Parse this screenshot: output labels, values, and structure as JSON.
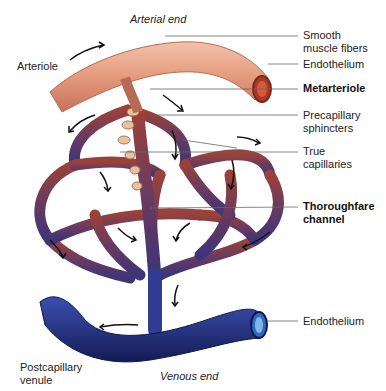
{
  "diagram": {
    "ends": {
      "arterial": "Arterial end",
      "venous": "Venous end"
    },
    "labels": {
      "arteriole": "Arteriole",
      "smooth_muscle": "Smooth\nmuscle fibers",
      "endothelium_top": "Endothelium",
      "metarteriole": "Metarteriole",
      "precapillary": "Precapillary\nsphincters",
      "true_capillaries": "True\ncapillaries",
      "thoroughfare": "Thoroughfare\nchannel",
      "endothelium_bottom": "Endothelium",
      "postcapillary": "Postcapillary\nvenule"
    },
    "colors": {
      "arteriole": "#e8a184",
      "arteriole_dark": "#b9614a",
      "capillary_red": "#8a3a3a",
      "capillary_purple": "#5e3a6e",
      "venule": "#2a3a8c",
      "venule_dark": "#17215a",
      "leader": "#555555"
    }
  }
}
